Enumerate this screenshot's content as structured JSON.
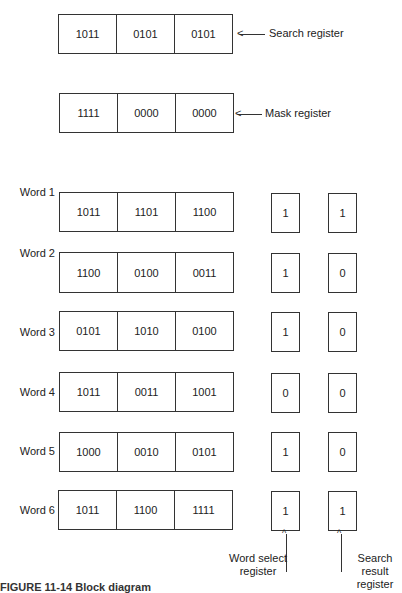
{
  "search_register": {
    "label": "Search register",
    "fields": [
      "1011",
      "0101",
      "0101"
    ]
  },
  "mask_register": {
    "label": "Mask register",
    "fields": [
      "1111",
      "0000",
      "0000"
    ]
  },
  "words": [
    {
      "label": "Word 1",
      "fields": [
        "1011",
        "1101",
        "1100"
      ],
      "select": "1",
      "result": "1"
    },
    {
      "label": "Word 2",
      "fields": [
        "1100",
        "0100",
        "0011"
      ],
      "select": "1",
      "result": "0"
    },
    {
      "label": "Word 3",
      "fields": [
        "0101",
        "1010",
        "0100"
      ],
      "select": "1",
      "result": "0"
    },
    {
      "label": "Word 4",
      "fields": [
        "1011",
        "0011",
        "1001"
      ],
      "select": "0",
      "result": "0"
    },
    {
      "label": "Word 5",
      "fields": [
        "1000",
        "0010",
        "0101"
      ],
      "select": "1",
      "result": "0"
    },
    {
      "label": "Word 6",
      "fields": [
        "1011",
        "1100",
        "1111"
      ],
      "select": "1",
      "result": "1"
    }
  ],
  "word_select_register": {
    "label_line1": "Word select",
    "label_line2": "register"
  },
  "search_result_register": {
    "label_line1": "Search result",
    "label_line2": "register"
  },
  "caption": "FIGURE 11-14  Block diagram"
}
